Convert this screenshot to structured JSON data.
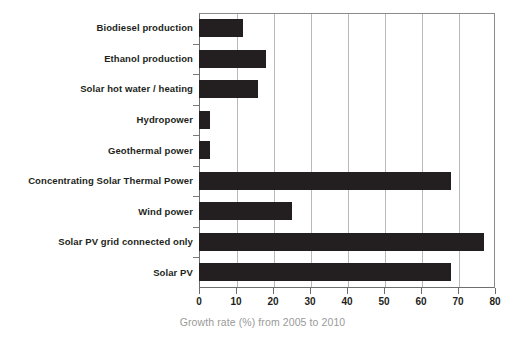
{
  "chart_data": {
    "type": "bar",
    "orientation": "horizontal",
    "title": "",
    "xlabel": "Growth rate (%) from 2005 to 2010",
    "ylabel": "",
    "xlim": [
      0,
      80
    ],
    "xticks": [
      0,
      10,
      20,
      30,
      40,
      50,
      60,
      70,
      80
    ],
    "grid": true,
    "grid_axis": "x",
    "legend": false,
    "bar_color": "#231f20",
    "categories": [
      "Biodiesel production",
      "Ethanol production",
      "Solar hot water / heating",
      "Hydropower",
      "Geothermal power",
      "Concentrating Solar Thermal Power",
      "Wind power",
      "Solar PV grid connected only",
      "Solar PV"
    ],
    "values": [
      12,
      18,
      16,
      3,
      3,
      68,
      25,
      77,
      68
    ]
  },
  "colors": {
    "bar": "#231f20",
    "axis": "#6e6e6e",
    "grid": "#b9b9b9",
    "caption": "#9a9a9a",
    "label": "#231f20",
    "background": "#ffffff"
  }
}
